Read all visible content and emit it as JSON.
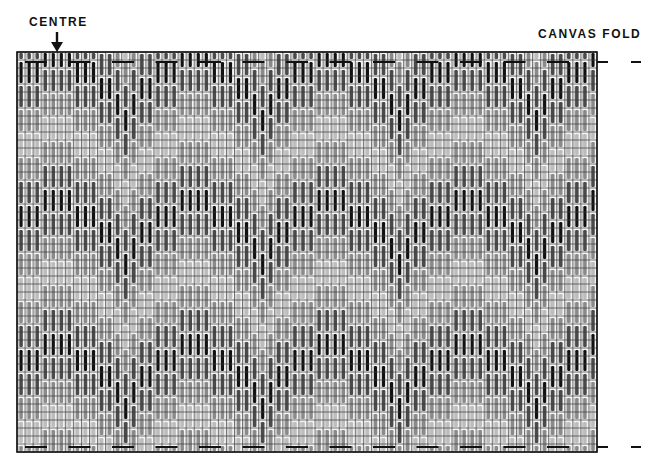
{
  "labels": {
    "centre": "CENTRE",
    "canvas_fold": "CANVAS FOLD"
  },
  "icons": {
    "centre_arrow": "arrow-down-icon",
    "fold_marker": "dash-marker-icon"
  },
  "grid": {
    "left": 17,
    "top": 52,
    "width": 580,
    "height": 400,
    "cell": 8.05,
    "columns": 72,
    "rows": 50,
    "frame_color": "#111111",
    "grid_line_color": "#3a3a3a"
  },
  "stitch_pattern": {
    "type": "bargello flame",
    "band_rows": 3,
    "stitch_rows": 4,
    "color_cycle": [
      "#111111",
      "#4a4a4a",
      "#8a8a8a",
      "#bdbdbd",
      "#8a8a8a",
      "#4a4a4a"
    ],
    "column_offsets": [
      2,
      2,
      2,
      0,
      0,
      0,
      0,
      2,
      2,
      2,
      4,
      4,
      6,
      8,
      6,
      4,
      4
    ],
    "phase_start_row": -1
  },
  "fold_markers": {
    "top_y": 62,
    "bottom_y": 447,
    "dash_start": 25,
    "dash_length": 22,
    "dash_period": 43.5,
    "outside_marks": [
      {
        "x1": 597,
        "x2": 608
      },
      {
        "x1": 631,
        "x2": 641
      }
    ],
    "color": "#111111"
  }
}
